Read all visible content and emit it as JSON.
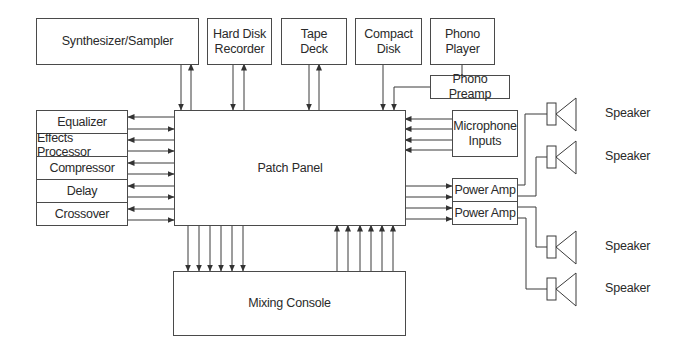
{
  "diagram": {
    "type": "audio-signal-flow-block-diagram",
    "center": {
      "label": "Patch Panel"
    },
    "sources_top": [
      {
        "id": "synth",
        "label": "Synthesizer/Sampler",
        "connection": "bidirectional"
      },
      {
        "id": "hdr",
        "label": "Hard Disk\nRecorder",
        "connection": "bidirectional"
      },
      {
        "id": "tape",
        "label": "Tape\nDeck",
        "connection": "bidirectional"
      },
      {
        "id": "cd",
        "label": "Compact\nDisk",
        "connection": "to-patch-panel"
      },
      {
        "id": "phono",
        "label": "Phono\nPlayer",
        "connection": "via-phono-preamp"
      }
    ],
    "phono_preamp": {
      "label": "Phono Preamp"
    },
    "processors_left": [
      {
        "label": "Equalizer"
      },
      {
        "label": "Effects Processor"
      },
      {
        "label": "Compressor"
      },
      {
        "label": "Delay"
      },
      {
        "label": "Crossover"
      }
    ],
    "microphone_inputs": {
      "label": "Microphone\nInputs",
      "lines": 4
    },
    "power_amps": [
      {
        "label": "Power Amp"
      },
      {
        "label": "Power Amp"
      }
    ],
    "speakers": [
      {
        "label": "Speaker"
      },
      {
        "label": "Speaker"
      },
      {
        "label": "Speaker"
      },
      {
        "label": "Speaker"
      }
    ],
    "mixing_console": {
      "label": "Mixing Console",
      "sends": 6,
      "returns": 6
    }
  },
  "colors": {
    "line": "#3a3a3a",
    "box_border": "#4a4a4a",
    "background": "#ffffff",
    "text": "#2a2a2a"
  }
}
